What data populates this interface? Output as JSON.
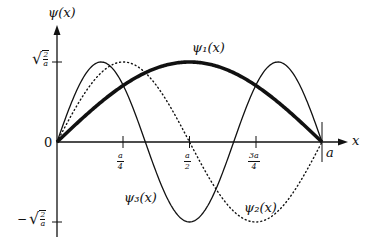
{
  "chart_data": {
    "type": "line",
    "title": "",
    "xlabel": "x",
    "ylabel": "ψ(x)",
    "x_range": [
      0,
      1
    ],
    "x_unit": "a",
    "ylim": [
      -1,
      1
    ],
    "y_unit": "√(2/a)",
    "grid": false,
    "legend": "inline labels on curves",
    "x_ticks": [
      "a/4",
      "a/2",
      "3a/4"
    ],
    "x_end_label": "a",
    "y_ticks": [
      "√(2/a)",
      "−√(2/a)"
    ],
    "origin_label": "0",
    "series": [
      {
        "name": "ψ1(x)",
        "n": 1,
        "formula": "sqrt(2/a) sin(πx/a)",
        "style": "thick solid",
        "x": [
          0,
          0.125,
          0.25,
          0.375,
          0.5,
          0.625,
          0.75,
          0.875,
          1
        ],
        "y": [
          0,
          0.383,
          0.707,
          0.924,
          1.0,
          0.924,
          0.707,
          0.383,
          0
        ]
      },
      {
        "name": "ψ2(x)",
        "n": 2,
        "formula": "sqrt(2/a) sin(2πx/a)",
        "style": "dotted",
        "x": [
          0,
          0.125,
          0.25,
          0.375,
          0.5,
          0.625,
          0.75,
          0.875,
          1
        ],
        "y": [
          0,
          0.707,
          1.0,
          0.707,
          0,
          -0.707,
          -1.0,
          -0.707,
          0
        ]
      },
      {
        "name": "ψ3(x)",
        "n": 3,
        "formula": "sqrt(2/a) sin(3πx/a)",
        "style": "thin solid",
        "x": [
          0,
          0.125,
          0.25,
          0.375,
          0.5,
          0.625,
          0.75,
          0.875,
          1
        ],
        "y": [
          0,
          0.924,
          0.707,
          -0.383,
          -1.0,
          -0.383,
          0.707,
          0.924,
          0
        ]
      }
    ]
  },
  "labels": {
    "y_axis": "ψ(x)",
    "x_axis": "x",
    "origin": "0",
    "x_end": "a",
    "psi1": "ψ₁(x)",
    "psi2": "ψ₂(x)",
    "psi3": "ψ₃(x)",
    "tick_quarter_num": "a",
    "tick_quarter_den": "4",
    "tick_half_num": "a",
    "tick_half_den": "2",
    "tick_3q_num": "3a",
    "tick_3q_den": "4",
    "amp_num": "2",
    "amp_den": "a",
    "sqrt_sign": "√",
    "minus": "−"
  },
  "colors": {
    "ink": "#111111",
    "background": "#ffffff"
  }
}
